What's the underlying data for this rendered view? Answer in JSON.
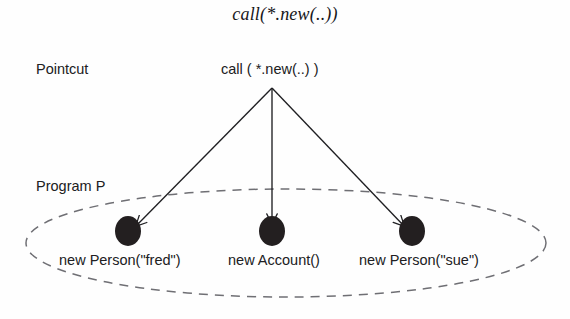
{
  "figure": {
    "title": "call(*.new(..))",
    "background_color": "#fefefe",
    "ink_color": "#1f1f22"
  },
  "labels": {
    "pointcut": "Pointcut",
    "program": "Program P"
  },
  "pointcut": {
    "expression": "call ( *.new(..) )",
    "origin_x": 272,
    "origin_y": 88
  },
  "program_region": {
    "shape": "ellipse",
    "stroke_style": "dashed",
    "stroke_color": "#6f6f74",
    "center_x": 286,
    "center_y": 243,
    "radius_x": 260,
    "radius_y": 54
  },
  "join_points": [
    {
      "label": "new Person(\"fred\")",
      "dot_x": 128,
      "dot_y": 231,
      "dot_color": "#231f20",
      "arrow_from_x": 272,
      "arrow_from_y": 88,
      "arrow_to_x": 136,
      "arrow_to_y": 226
    },
    {
      "label": "new Account()",
      "dot_x": 272,
      "dot_y": 231,
      "dot_color": "#231f20",
      "arrow_from_x": 272,
      "arrow_from_y": 88,
      "arrow_to_x": 272,
      "arrow_to_y": 224
    },
    {
      "label": "new Person(\"sue\")",
      "dot_x": 412,
      "dot_y": 231,
      "dot_color": "#231f20",
      "arrow_from_x": 272,
      "arrow_from_y": 88,
      "arrow_to_x": 404,
      "arrow_to_y": 226
    }
  ]
}
